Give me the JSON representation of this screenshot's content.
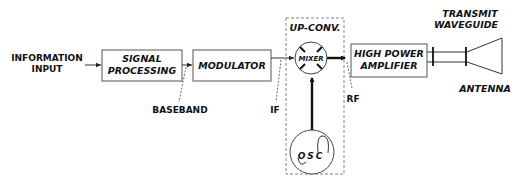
{
  "diagram": {
    "type": "block-diagram",
    "input_label": [
      "INFORMATION",
      "INPUT"
    ],
    "blocks": [
      {
        "id": "signal_processing",
        "lines": [
          "SIGNAL",
          "PROCESSING"
        ]
      },
      {
        "id": "modulator",
        "lines": [
          "MODULATOR"
        ]
      },
      {
        "id": "mixer",
        "lines": [
          "MIXER"
        ]
      },
      {
        "id": "oscillator",
        "lines": [
          "OSC"
        ]
      },
      {
        "id": "high_power_amplifier",
        "lines": [
          "HIGH POWER",
          "AMPLIFIER"
        ]
      }
    ],
    "group": {
      "label": "UP-CONV.",
      "contains": [
        "mixer",
        "oscillator"
      ]
    },
    "signal_labels": {
      "baseband": "BASEBAND",
      "if": "IF",
      "rf": "RF"
    },
    "waveguide_label": [
      "TRANSMIT",
      "WAVEGUIDE"
    ],
    "antenna_label": "ANTENNA",
    "connections": [
      {
        "from": "input",
        "to": "signal_processing"
      },
      {
        "from": "signal_processing",
        "to": "modulator",
        "label": "BASEBAND"
      },
      {
        "from": "modulator",
        "to": "mixer",
        "label": "IF"
      },
      {
        "from": "oscillator",
        "to": "mixer"
      },
      {
        "from": "mixer",
        "to": "high_power_amplifier",
        "label": "RF"
      },
      {
        "from": "high_power_amplifier",
        "to": "antenna",
        "via": "transmit waveguide"
      }
    ]
  }
}
